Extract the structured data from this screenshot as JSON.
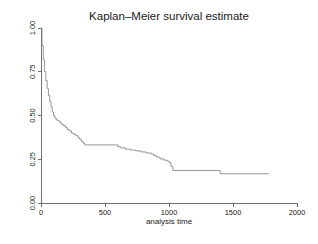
{
  "figure": {
    "width": 318,
    "height": 244,
    "background_color": "#ffffff"
  },
  "chart_data": {
    "type": "line",
    "subtype": "step",
    "title": "Kaplan–Meier survival estimate",
    "subtitle": "",
    "xlabel": "analysis time",
    "ylabel": "",
    "xlim": [
      0,
      2000
    ],
    "ylim": [
      0.0,
      1.0
    ],
    "xticks": [
      0,
      500,
      1000,
      1500,
      2000
    ],
    "xticklabels": [
      "0",
      "500",
      "1000",
      "1500",
      "2000"
    ],
    "yticks": [
      0.0,
      0.25,
      0.5,
      0.75,
      1.0
    ],
    "yticklabels": [
      "0.00",
      "0.25",
      "0.50",
      "0.75",
      "1.00"
    ],
    "grid": false,
    "legend": false,
    "legend_position": "none",
    "axis_style": "left-and-bottom-only",
    "line_color": "#8a8a8a",
    "series": [
      {
        "name": "survival probability",
        "x": [
          0,
          8,
          18,
          28,
          38,
          48,
          58,
          68,
          78,
          88,
          98,
          108,
          118,
          132,
          148,
          160,
          175,
          190,
          205,
          220,
          238,
          255,
          272,
          288,
          300,
          315,
          330,
          342,
          580,
          600,
          620,
          660,
          700,
          740,
          780,
          820,
          860,
          880,
          900,
          930,
          960,
          985,
          1000,
          1015,
          1030,
          1380,
          1400,
          1780
        ],
        "y": [
          1.0,
          0.9,
          0.82,
          0.75,
          0.7,
          0.655,
          0.615,
          0.58,
          0.55,
          0.52,
          0.5,
          0.487,
          0.475,
          0.47,
          0.458,
          0.45,
          0.442,
          0.432,
          0.42,
          0.412,
          0.4,
          0.392,
          0.385,
          0.375,
          0.365,
          0.352,
          0.34,
          0.332,
          0.332,
          0.322,
          0.315,
          0.308,
          0.302,
          0.298,
          0.292,
          0.286,
          0.28,
          0.272,
          0.262,
          0.252,
          0.245,
          0.24,
          0.232,
          0.21,
          0.186,
          0.186,
          0.167,
          0.167
        ]
      }
    ],
    "annotations": []
  }
}
